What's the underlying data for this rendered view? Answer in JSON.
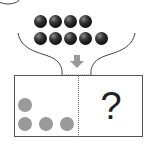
{
  "diagram": {
    "label_circle": "",
    "top_balls": {
      "row1_count": 4,
      "row2_count": 5,
      "total": 9,
      "color": "#111111"
    },
    "arrow": {
      "direction": "down",
      "color": "#999999"
    },
    "left_panel": {
      "dot_count": 4,
      "dot_color": "#9a9a9a"
    },
    "right_panel": {
      "text": "?"
    }
  }
}
